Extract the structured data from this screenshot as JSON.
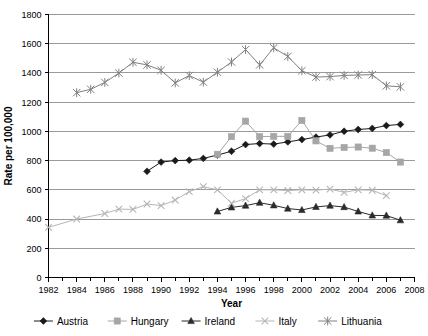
{
  "chart_data": {
    "type": "line",
    "title": "",
    "xlabel": "Year",
    "ylabel": "Rate per 100,000",
    "xlim": [
      1982,
      2008
    ],
    "ylim": [
      0,
      1800
    ],
    "x_tick_labels": [
      "1982",
      "1984",
      "1986",
      "1988",
      "1990",
      "1992",
      "1994",
      "1996",
      "1998",
      "2000",
      "2002",
      "2004",
      "2006",
      "2008"
    ],
    "x_tick_values": [
      1982,
      1984,
      1986,
      1988,
      1990,
      1992,
      1994,
      1996,
      1998,
      2000,
      2002,
      2004,
      2006,
      2008
    ],
    "x_minor_tick_values": [
      1983,
      1985,
      1987,
      1989,
      1991,
      1993,
      1995,
      1997,
      1999,
      2001,
      2003,
      2005,
      2007
    ],
    "y_tick_labels": [
      "0",
      "200",
      "400",
      "600",
      "800",
      "1000",
      "1200",
      "1400",
      "1600",
      "1800"
    ],
    "y_tick_values": [
      0,
      200,
      400,
      600,
      800,
      1000,
      1200,
      1400,
      1600,
      1800
    ],
    "grid": "horizontal",
    "legend_position": "bottom",
    "series": [
      {
        "name": "Austria",
        "marker": "diamond",
        "color": "#1a1a1a",
        "line_color": "#1a1a1a",
        "x": [
          1989,
          1990,
          1991,
          1992,
          1993,
          1994,
          1995,
          1996,
          1997,
          1998,
          1999,
          2000,
          2001,
          2002,
          2003,
          2004,
          2005,
          2006,
          2007
        ],
        "y": [
          727,
          790,
          800,
          803,
          815,
          838,
          864,
          910,
          917,
          913,
          928,
          944,
          961,
          976,
          1001,
          1013,
          1020,
          1040,
          1048
        ]
      },
      {
        "name": "Hungary",
        "marker": "square",
        "color": "#a6a6a6",
        "line_color": "#a6a6a6",
        "x": [
          1994,
          1995,
          1996,
          1997,
          1998,
          1999,
          2000,
          2001,
          2002,
          2003,
          2004,
          2005,
          2006,
          2007
        ],
        "y": [
          843,
          964,
          1070,
          964,
          966,
          966,
          1075,
          935,
          884,
          890,
          893,
          885,
          855,
          790
        ]
      },
      {
        "name": "Ireland",
        "marker": "triangle",
        "color": "#2b2b2b",
        "line_color": "#2b2b2b",
        "x": [
          1994,
          1995,
          1996,
          1997,
          1998,
          1999,
          2000,
          2001,
          2002,
          2003,
          2004,
          2005,
          2006,
          2007
        ],
        "y": [
          452,
          480,
          492,
          512,
          494,
          472,
          462,
          483,
          492,
          482,
          452,
          425,
          424,
          392
        ]
      },
      {
        "name": "Italy",
        "marker": "cross",
        "color": "#b5b5b5",
        "line_color": "#b5b5b5",
        "x": [
          1982,
          1984,
          1986,
          1987,
          1988,
          1989,
          1990,
          1991,
          1992,
          1993,
          1994,
          1995,
          1996,
          1997,
          1998,
          1999,
          2000,
          2001,
          2002,
          2003,
          2004,
          2005,
          2006
        ],
        "y": [
          343,
          400,
          438,
          468,
          466,
          503,
          492,
          530,
          588,
          622,
          600,
          508,
          540,
          600,
          600,
          595,
          600,
          598,
          605,
          583,
          600,
          597,
          560
        ]
      },
      {
        "name": "Lithuania",
        "marker": "asterisk",
        "color": "#808080",
        "line_color": "#808080",
        "x": [
          1984,
          1985,
          1986,
          1987,
          1988,
          1989,
          1990,
          1991,
          1992,
          1993,
          1994,
          1995,
          1996,
          1997,
          1998,
          1999,
          2000,
          2001,
          2002,
          2003,
          2004,
          2005,
          2006,
          2007
        ],
        "y": [
          1265,
          1288,
          1335,
          1399,
          1473,
          1455,
          1418,
          1332,
          1382,
          1337,
          1405,
          1475,
          1560,
          1455,
          1572,
          1513,
          1415,
          1372,
          1375,
          1383,
          1386,
          1388,
          1312,
          1305
        ]
      }
    ]
  },
  "legend": {
    "items": [
      {
        "label": "Austria",
        "marker": "diamond",
        "color": "#1a1a1a"
      },
      {
        "label": "Hungary",
        "marker": "square",
        "color": "#a6a6a6"
      },
      {
        "label": "Ireland",
        "marker": "triangle",
        "color": "#2b2b2b"
      },
      {
        "label": "Italy",
        "marker": "cross",
        "color": "#b5b5b5"
      },
      {
        "label": "Lithuania",
        "marker": "asterisk",
        "color": "#808080"
      }
    ]
  }
}
